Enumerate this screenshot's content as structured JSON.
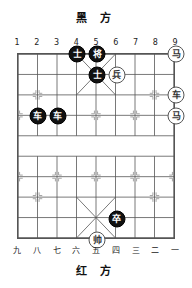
{
  "board": {
    "top_label": "黑 方",
    "bottom_label": "红 方",
    "file_labels_top": [
      "1",
      "2",
      "3",
      "4",
      "5",
      "6",
      "7",
      "8",
      "9"
    ],
    "file_labels_bottom": [
      "九",
      "八",
      "七",
      "六",
      "五",
      "四",
      "三",
      "二",
      "一"
    ],
    "columns": 9,
    "rows": 10,
    "colors": {
      "black_piece_bg": "#111111",
      "black_piece_text": "#ffffff",
      "red_piece_bg": "#ffffff",
      "red_piece_text": "#333333",
      "line": "#555555",
      "background": "#ffffff"
    }
  },
  "pieces": [
    {
      "name": "black-advisor-c4r1",
      "glyph": "士",
      "side": "black",
      "col": 4,
      "row": 1
    },
    {
      "name": "black-general-c5r1",
      "glyph": "将",
      "side": "black",
      "col": 5,
      "row": 1
    },
    {
      "name": "red-horse-c9r1",
      "glyph": "马",
      "side": "red",
      "col": 9,
      "row": 1
    },
    {
      "name": "black-advisor-c5r2",
      "glyph": "士",
      "side": "black",
      "col": 5,
      "row": 2
    },
    {
      "name": "red-soldier-c6r2",
      "glyph": "兵",
      "side": "red",
      "col": 6,
      "row": 2
    },
    {
      "name": "red-chariot-c9r3",
      "glyph": "车",
      "side": "red",
      "col": 9,
      "row": 3
    },
    {
      "name": "black-chariot-c2r4",
      "glyph": "车",
      "side": "black",
      "col": 2,
      "row": 4
    },
    {
      "name": "black-chariot-c3r4",
      "glyph": "车",
      "side": "black",
      "col": 3,
      "row": 4
    },
    {
      "name": "red-horse-c9r4",
      "glyph": "马",
      "side": "red",
      "col": 9,
      "row": 4
    },
    {
      "name": "black-soldier-c6r9",
      "glyph": "卒",
      "side": "black",
      "col": 6,
      "row": 9
    },
    {
      "name": "red-general-c5r10",
      "glyph": "帅",
      "side": "red",
      "col": 5,
      "row": 10
    }
  ]
}
